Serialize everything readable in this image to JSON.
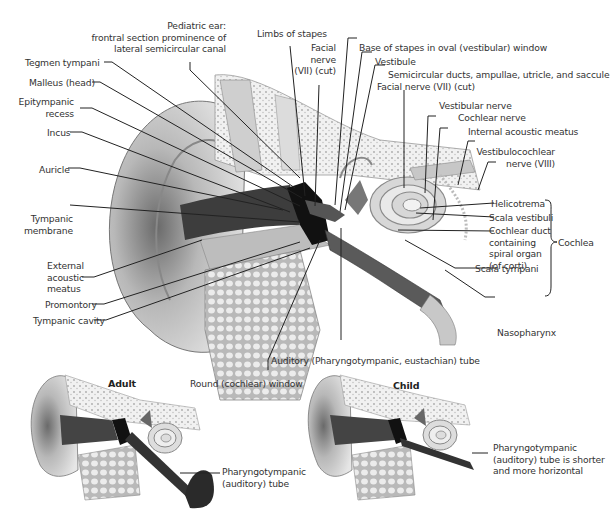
{
  "main_figure": {
    "labels_left": [
      {
        "id": "pediatric-ear",
        "text": "Pediatric ear:\nfrontral section prominence of\nlateral semicircular canal"
      },
      {
        "id": "tegmen-tympani",
        "text": "Tegmen tympani"
      },
      {
        "id": "malleus-head",
        "text": "Malleus (head)"
      },
      {
        "id": "epitympanic-recess",
        "text": "Epitympanic\nrecess"
      },
      {
        "id": "incus",
        "text": "Incus"
      },
      {
        "id": "auricle",
        "text": "Auricle"
      },
      {
        "id": "tympanic-membrane",
        "text": "Tympanic\nmembrane"
      },
      {
        "id": "external-acoustic-meatus",
        "text": "External\nacoustic\nmeatus"
      },
      {
        "id": "promontory",
        "text": "Promontory"
      },
      {
        "id": "tympanic-cavity",
        "text": "Tympanic cavity"
      }
    ],
    "labels_top": [
      {
        "id": "limbs-of-stapes",
        "text": "Limbs of stapes"
      },
      {
        "id": "facial-nerve-1",
        "text": "Facial\nnerve\n(VII) (cut)"
      },
      {
        "id": "base-of-stapes",
        "text": "Base of stapes in oval (vestibular) window"
      },
      {
        "id": "vestibule",
        "text": "Vestibule"
      },
      {
        "id": "semicircular-ducts",
        "text": "Semicircular ducts, ampullae, utricle, and saccule"
      },
      {
        "id": "facial-nerve-2",
        "text": "Facial nerve (VII) (cut)"
      }
    ],
    "labels_right": [
      {
        "id": "vestibular-nerve",
        "text": "Vestibular nerve"
      },
      {
        "id": "cochlear-nerve",
        "text": "Cochlear nerve"
      },
      {
        "id": "internal-acoustic-meatus",
        "text": "Internal acoustic meatus"
      },
      {
        "id": "vestibulocochlear-nerve",
        "text": "Vestibulocochlear\nnerve (VIII)"
      },
      {
        "id": "helicotrema",
        "text": "Helicotrema"
      },
      {
        "id": "scala-vestibuli",
        "text": "Scala vestibuli"
      },
      {
        "id": "cochlear-duct",
        "text": "Cochlear duct\ncontaining\nspiral organ\n(of corti)"
      },
      {
        "id": "scala-tympani",
        "text": "Scala tympani"
      },
      {
        "id": "cochlea",
        "text": "Cochlea"
      },
      {
        "id": "nasopharynx",
        "text": "Nasopharynx"
      }
    ],
    "labels_bottom": [
      {
        "id": "auditory-tube",
        "text": "Auditory (Pharyngotympanic, eustachian) tube"
      },
      {
        "id": "round-window",
        "text": "Round (cochlear) window"
      }
    ]
  },
  "adult_inset": {
    "title": "Adult",
    "label": "Pharyngotympanic\n(auditory) tube"
  },
  "child_inset": {
    "title": "Child",
    "label": "Pharyngotympanic\n(auditory) tube is shorter\nand more horizontal"
  }
}
